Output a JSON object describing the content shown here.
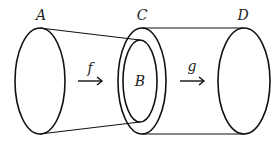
{
  "diagram": {
    "type": "set-mapping",
    "sets": [
      {
        "id": "A",
        "label": "A"
      },
      {
        "id": "B",
        "label": "B"
      },
      {
        "id": "C",
        "label": "C"
      },
      {
        "id": "D",
        "label": "D"
      }
    ],
    "maps": [
      {
        "id": "f",
        "label": "f",
        "from": "A",
        "to": "B"
      },
      {
        "id": "g",
        "label": "g",
        "from": "C",
        "to": "D"
      }
    ],
    "relations": [
      {
        "inner": "B",
        "outer": "C",
        "type": "subset"
      }
    ],
    "colors": {
      "stroke": "#111111",
      "text": "#222222",
      "background": "#ffffff"
    }
  }
}
